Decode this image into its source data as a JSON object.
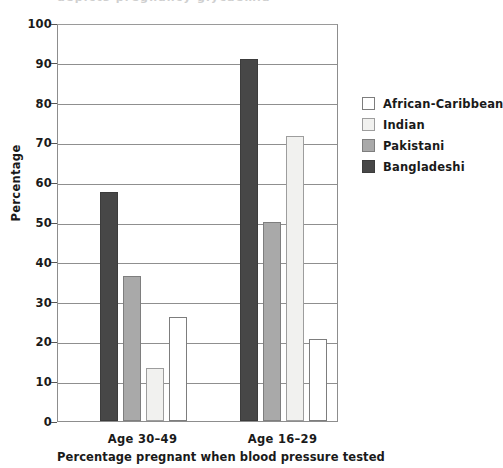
{
  "top_clipped_text": "depicts pregnancy glycaemia",
  "chart_data": {
    "type": "bar",
    "title": "",
    "xlabel": "Percentage pregnant when blood pressure tested",
    "ylabel": "Percentage",
    "categories": [
      "Age 30–49",
      "Age 16–29"
    ],
    "ylim": [
      0,
      100
    ],
    "ytick_step": 10,
    "yticks": [
      0,
      10,
      20,
      30,
      40,
      50,
      60,
      70,
      80,
      90,
      100
    ],
    "grid": true,
    "legend_position": "right",
    "series": [
      {
        "name": "African-Caribbean",
        "color": "#ffffff",
        "values": [
          26.2,
          20.7
        ]
      },
      {
        "name": "Indian",
        "color": "#f1f1ef",
        "values": [
          13.3,
          71.5
        ]
      },
      {
        "name": "Pakistani",
        "color": "#a9a9a9",
        "values": [
          36.5,
          50.0
        ]
      },
      {
        "name": "Bangladeshi",
        "color": "#474747",
        "values": [
          57.5,
          91.0
        ]
      }
    ],
    "bar_draw_order": [
      "Bangladeshi",
      "Pakistani",
      "Indian",
      "African-Caribbean"
    ]
  }
}
